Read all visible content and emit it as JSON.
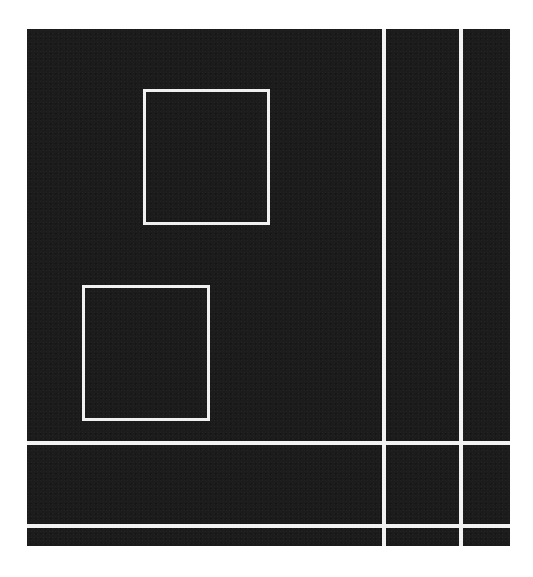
{
  "artwork": {
    "background_color": "#1c1c1c",
    "line_color": "#f2f2f2",
    "canvas": {
      "x": 27,
      "y": 29,
      "width": 483,
      "height": 517
    },
    "vertical_lines": [
      {
        "x": 382,
        "width": 4
      },
      {
        "x": 459,
        "width": 4
      }
    ],
    "horizontal_lines": [
      {
        "y": 441,
        "height": 4
      },
      {
        "y": 524,
        "height": 4
      }
    ],
    "boxes": [
      {
        "name": "upper-square",
        "x": 143,
        "y": 89,
        "width": 127,
        "height": 136
      },
      {
        "name": "lower-square",
        "x": 82,
        "y": 285,
        "width": 128,
        "height": 136
      }
    ]
  }
}
